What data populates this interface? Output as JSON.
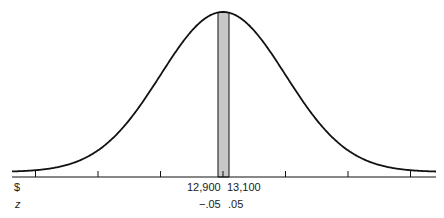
{
  "chart_data": {
    "type": "area",
    "title": "",
    "xlabel": "",
    "ylabel": "",
    "axis_rows": [
      {
        "label": "$",
        "tick_labels": [
          "12,900",
          "13,100"
        ]
      },
      {
        "label": "z",
        "tick_labels": [
          "-.05",
          ".05"
        ]
      }
    ],
    "z_ticks": [
      -3,
      -2,
      -1,
      0,
      1,
      2,
      3
    ],
    "shaded_region": {
      "z_from": -0.05,
      "z_to": 0.05,
      "dollar_from": 12900,
      "dollar_to": 13100,
      "color": "#c8c8c8"
    },
    "curve": {
      "mean_z": 0,
      "sd_z": 1,
      "color": "#111111"
    },
    "grid": false,
    "legend": null
  },
  "labels": {
    "dollar_row": "$",
    "z_row": "z",
    "dollar_left": "12,900",
    "dollar_right": "13,100",
    "z_left": "−.05",
    "z_right": ".05"
  }
}
